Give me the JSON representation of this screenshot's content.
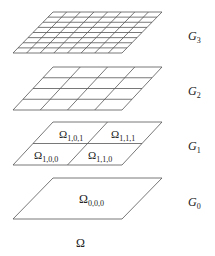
{
  "diagram": {
    "type": "hierarchical grid levels",
    "line_color": "#555555",
    "levels": [
      {
        "name": "G3",
        "label_main": "G",
        "label_sub": "3",
        "divisions": 8,
        "cells": []
      },
      {
        "name": "G2",
        "label_main": "G",
        "label_sub": "2",
        "divisions": 4,
        "cells": []
      },
      {
        "name": "G1",
        "label_main": "G",
        "label_sub": "1",
        "divisions": 2,
        "cells": [
          {
            "main": "Ω",
            "sub": "1,0,1"
          },
          {
            "main": "Ω",
            "sub": "1,1,1"
          },
          {
            "main": "Ω",
            "sub": "1,0,0"
          },
          {
            "main": "Ω",
            "sub": "1,1,0"
          }
        ]
      },
      {
        "name": "G0",
        "label_main": "G",
        "label_sub": "0",
        "divisions": 1,
        "cells": [
          {
            "main": "Ω",
            "sub": "0,0,0"
          }
        ]
      }
    ],
    "domain_label": "Ω"
  }
}
